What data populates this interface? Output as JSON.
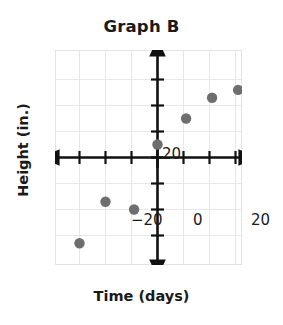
{
  "chart_data": {
    "type": "scatter",
    "title": "Graph B",
    "xlabel": "Time (days)",
    "ylabel": "Height (in.)",
    "xlim": [
      -39,
      33
    ],
    "ylim": [
      -41,
      41
    ],
    "grid": true,
    "legend": null,
    "x_tick_labels": [
      "-20",
      "0",
      "20"
    ],
    "x_tick_values": [
      -20,
      0,
      20
    ],
    "y_tick_labels": [
      "20"
    ],
    "y_tick_values": [
      20
    ],
    "minor_tick_interval": 5,
    "point_color": "#6e6e6e",
    "grid_color": "#e3e3e6",
    "axis_color": "#111111",
    "series": [
      {
        "name": "Height over time",
        "points": [
          {
            "x": -30,
            "y": -33
          },
          {
            "x": -20,
            "y": -17
          },
          {
            "x": -9,
            "y": -20
          },
          {
            "x": 0,
            "y": 5
          },
          {
            "x": 11,
            "y": 15
          },
          {
            "x": 21,
            "y": 23
          },
          {
            "x": 31,
            "y": 26
          }
        ]
      }
    ]
  },
  "axis_ticks": {
    "x_neg20": "−20",
    "x_zero": "0",
    "x_pos20": "20",
    "y_pos20": "20"
  }
}
